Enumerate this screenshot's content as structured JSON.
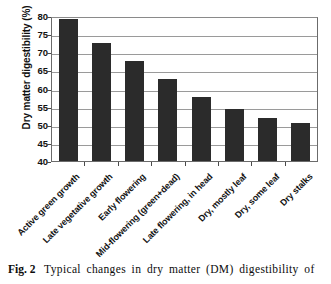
{
  "figure": {
    "caption_label": "Fig. 2",
    "caption_text": "Typical changes in dry matter (DM) digestibility of"
  },
  "chart_data": {
    "type": "bar",
    "title": "",
    "xlabel": "",
    "ylabel": "Dry matter digestibility (%)",
    "ylim": [
      40,
      80
    ],
    "yticks": [
      40,
      45,
      50,
      55,
      60,
      65,
      70,
      75,
      80
    ],
    "ytick_labels": [
      "40",
      "45",
      "50",
      "55",
      "60",
      "65",
      "70",
      "75",
      "80"
    ],
    "grid": true,
    "legend": false,
    "bar_color": "#2b2b2b",
    "categories": [
      "Active green growth",
      "Late vegetative growth",
      "Early flowering",
      "Mid-flowering (green+dead)",
      "Late flowering, in head",
      "Dry, mostly leaf",
      "Dry, some leaf",
      "Dry stalks"
    ],
    "values": [
      79.2,
      72.6,
      67.6,
      62.6,
      57.7,
      54.3,
      51.9,
      50.5
    ]
  }
}
